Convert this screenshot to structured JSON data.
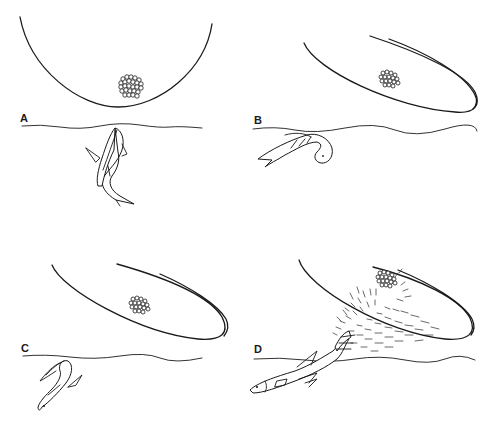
{
  "figure": {
    "line_color": "#1a1a1a",
    "background": "#ffffff",
    "panels": [
      {
        "id": "A",
        "label": "A",
        "leaf": "round-bowl",
        "fish_pose": "vertical, head at surface",
        "eggs": "cluster"
      },
      {
        "id": "B",
        "label": "B",
        "leaf": "elongated-tilted",
        "fish_pose": "curled below surface",
        "eggs": "cluster"
      },
      {
        "id": "C",
        "label": "C",
        "leaf": "elongated-tilted",
        "fish_pose": "flipped, belly up, diving",
        "eggs": "cluster"
      },
      {
        "id": "D",
        "label": "D",
        "leaf": "elongated-tilted",
        "fish_pose": "leaping with tail splash",
        "eggs": "cluster with water spray"
      }
    ]
  }
}
